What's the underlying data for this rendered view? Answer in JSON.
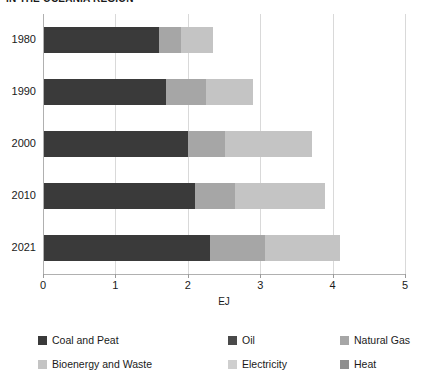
{
  "chart_data": {
    "type": "bar",
    "orientation": "horizontal",
    "stacked": true,
    "title": "IN THE OCEANIA REGION",
    "xlabel": "EJ",
    "ylabel": "",
    "xlim": [
      0,
      5
    ],
    "xticks": [
      0,
      1,
      2,
      3,
      4,
      5
    ],
    "xtick_labels": [
      "0",
      "1",
      "2",
      "3",
      "4",
      "5"
    ],
    "categories": [
      "1980",
      "1990",
      "2000",
      "2010",
      "2021"
    ],
    "grid": true,
    "legend_position": "bottom",
    "series": [
      {
        "name": "Coal and Peat",
        "color": "#3a3a3a",
        "values": [
          1.6,
          1.7,
          2.0,
          2.1,
          2.3
        ]
      },
      {
        "name": "Oil",
        "color": "#4a4a4a",
        "values": [
          0.0,
          0.0,
          0.0,
          0.0,
          0.0
        ]
      },
      {
        "name": "Natural Gas",
        "color": "#a6a6a6",
        "values": [
          0.3,
          0.55,
          0.52,
          0.55,
          0.77
        ]
      },
      {
        "name": "Bioenergy and Waste",
        "color": "#c4c4c4",
        "values": [
          0.45,
          0.65,
          1.2,
          1.25,
          1.03
        ]
      },
      {
        "name": "Electricity",
        "color": "#cfcfcf",
        "values": [
          0.0,
          0.0,
          0.0,
          0.0,
          0.0
        ]
      },
      {
        "name": "Heat",
        "color": "#8f8f8f",
        "values": [
          0.0,
          0.0,
          0.0,
          0.0,
          0.0
        ]
      }
    ],
    "totals": [
      2.35,
      2.9,
      3.72,
      3.9,
      4.1
    ]
  },
  "legend": {
    "entries": [
      {
        "label": "Coal and Peat",
        "color": "#3a3a3a",
        "col": 0,
        "row": 0
      },
      {
        "label": "Oil",
        "color": "#4a4a4a",
        "col": 1,
        "row": 0
      },
      {
        "label": "Natural Gas",
        "color": "#a6a6a6",
        "col": 2,
        "row": 0
      },
      {
        "label": "Bioenergy and Waste",
        "color": "#c4c4c4",
        "col": 0,
        "row": 1
      },
      {
        "label": "Electricity",
        "color": "#cfcfcf",
        "col": 1,
        "row": 1
      },
      {
        "label": "Heat",
        "color": "#8f8f8f",
        "col": 2,
        "row": 1
      }
    ]
  },
  "colors": {
    "background": "#ffffff",
    "grid": "#d9d9d9",
    "axis": "#b0b0b0",
    "text": "#1a1a1a"
  }
}
